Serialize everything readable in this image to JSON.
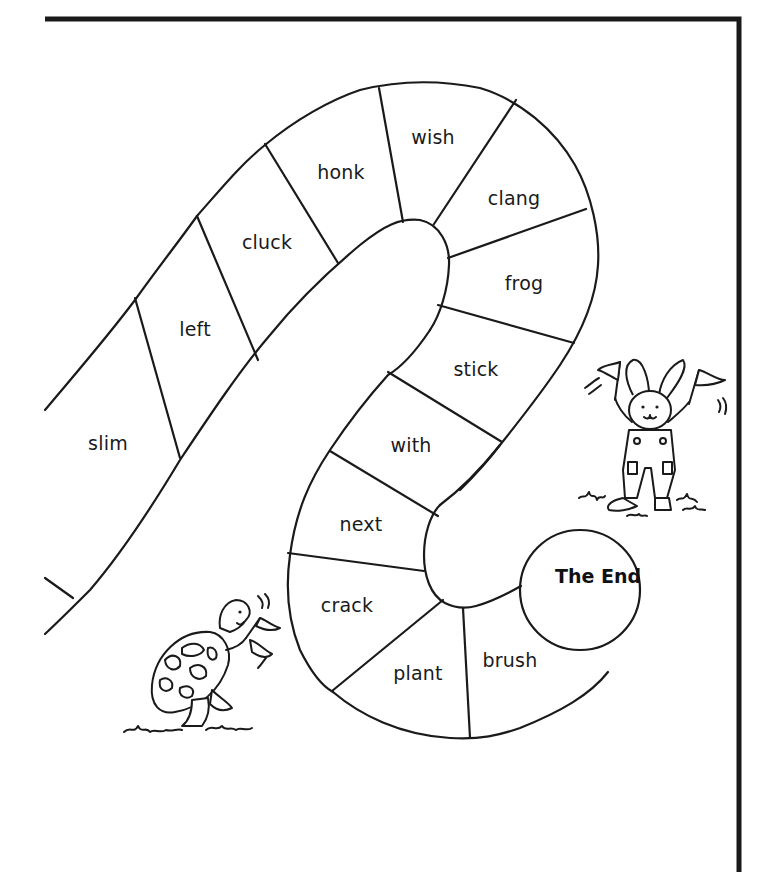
{
  "board": {
    "frame_color": "#1a1a1a",
    "background": "#ffffff",
    "spaces": [
      {
        "word": "slim",
        "x": 108,
        "y": 443
      },
      {
        "word": "left",
        "x": 195,
        "y": 329
      },
      {
        "word": "cluck",
        "x": 267,
        "y": 242
      },
      {
        "word": "honk",
        "x": 341,
        "y": 172
      },
      {
        "word": "wish",
        "x": 433,
        "y": 137
      },
      {
        "word": "clang",
        "x": 514,
        "y": 198
      },
      {
        "word": "frog",
        "x": 524,
        "y": 283
      },
      {
        "word": "stick",
        "x": 476,
        "y": 369
      },
      {
        "word": "with",
        "x": 411,
        "y": 445
      },
      {
        "word": "next",
        "x": 361,
        "y": 524
      },
      {
        "word": "crack",
        "x": 347,
        "y": 605
      },
      {
        "word": "plant",
        "x": 418,
        "y": 673
      },
      {
        "word": "brush",
        "x": 510,
        "y": 660
      }
    ],
    "finish": {
      "label": "The End",
      "x": 598,
      "y": 576
    }
  },
  "characters": {
    "rabbit": {
      "name": "rabbit-with-flags"
    },
    "turtle": {
      "name": "turtle-with-flag"
    }
  }
}
